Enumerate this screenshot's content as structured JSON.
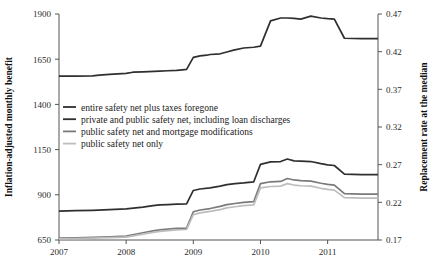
{
  "chart_data": {
    "type": "line",
    "title": "",
    "xlabel": "",
    "ylabel": "Inflation-adjusted monthly benefit",
    "y2label": "Replacement rate at the median",
    "xlim": [
      2007.0,
      2011.75
    ],
    "ylim": [
      650,
      1900
    ],
    "y2lim": [
      0.17,
      0.47
    ],
    "xticks": [
      2007,
      2008,
      2009,
      2010,
      2011
    ],
    "xtick_labels": [
      "2007",
      "2008",
      "2009",
      "2010",
      "2011"
    ],
    "yticks": [
      650,
      900,
      1150,
      1400,
      1650,
      1900
    ],
    "ytick_labels": [
      "650",
      "900",
      "1150",
      "1400",
      "1650",
      "1900"
    ],
    "y2ticks": [
      0.17,
      0.22,
      0.27,
      0.32,
      0.37,
      0.42,
      0.47
    ],
    "y2tick_labels": [
      "0.17",
      "0.22",
      "0.27",
      "0.32",
      "0.37",
      "0.42",
      "0.47"
    ],
    "grid": false,
    "legend_position": "center-left",
    "series": [
      {
        "name": "entire safety net plus taxes foregone",
        "color": "#2f2f2f",
        "width": 1.7,
        "x": [
          2007.0,
          2007.25,
          2007.5,
          2007.6,
          2007.75,
          2008.0,
          2008.1,
          2008.25,
          2008.5,
          2008.62,
          2008.75,
          2008.8,
          2008.9,
          2009.0,
          2009.1,
          2009.2,
          2009.25,
          2009.4,
          2009.5,
          2009.6,
          2009.75,
          2009.9,
          2010.0,
          2010.15,
          2010.3,
          2010.4,
          2010.5,
          2010.6,
          2010.75,
          2010.9,
          2011.0,
          2011.1,
          2011.25,
          2011.5,
          2011.75
        ],
        "y": [
          1556,
          1556,
          1558,
          1562,
          1566,
          1572,
          1578,
          1580,
          1584,
          1586,
          1588,
          1590,
          1594,
          1660,
          1668,
          1672,
          1676,
          1680,
          1690,
          1700,
          1712,
          1716,
          1722,
          1862,
          1878,
          1878,
          1876,
          1872,
          1888,
          1878,
          1874,
          1872,
          1766,
          1764,
          1764
        ]
      },
      {
        "name": "private and public safety net, including loan discharges",
        "color": "#2f2f2f",
        "width": 1.7,
        "x": [
          2007.0,
          2007.25,
          2007.5,
          2007.75,
          2008.0,
          2008.25,
          2008.4,
          2008.5,
          2008.62,
          2008.75,
          2008.9,
          2009.0,
          2009.1,
          2009.25,
          2009.4,
          2009.5,
          2009.62,
          2009.75,
          2009.9,
          2010.0,
          2010.15,
          2010.3,
          2010.4,
          2010.5,
          2010.6,
          2010.75,
          2010.9,
          2011.0,
          2011.1,
          2011.25,
          2011.5,
          2011.75
        ],
        "y": [
          810,
          812,
          814,
          818,
          822,
          832,
          840,
          844,
          846,
          848,
          850,
          924,
          932,
          938,
          948,
          956,
          962,
          966,
          972,
          1068,
          1082,
          1084,
          1098,
          1088,
          1086,
          1084,
          1072,
          1066,
          1062,
          1014,
          1012,
          1012
        ]
      },
      {
        "name": "public safety net and mortgage modifications",
        "color": "#7a7a7a",
        "width": 1.7,
        "x": [
          2007.0,
          2007.25,
          2007.5,
          2007.75,
          2008.0,
          2008.25,
          2008.4,
          2008.5,
          2008.62,
          2008.75,
          2008.9,
          2009.0,
          2009.1,
          2009.25,
          2009.4,
          2009.5,
          2009.62,
          2009.75,
          2009.9,
          2010.0,
          2010.15,
          2010.3,
          2010.4,
          2010.5,
          2010.6,
          2010.75,
          2010.9,
          2011.0,
          2011.1,
          2011.25,
          2011.5,
          2011.75
        ],
        "y": [
          660,
          662,
          664,
          668,
          672,
          690,
          700,
          706,
          710,
          714,
          716,
          806,
          816,
          824,
          836,
          846,
          852,
          858,
          862,
          962,
          972,
          974,
          990,
          982,
          978,
          976,
          964,
          958,
          954,
          906,
          904,
          904
        ]
      },
      {
        "name": "public safety net only",
        "color": "#bdbdbd",
        "width": 1.7,
        "x": [
          2007.0,
          2007.25,
          2007.5,
          2007.75,
          2008.0,
          2008.25,
          2008.4,
          2008.5,
          2008.62,
          2008.75,
          2008.9,
          2009.0,
          2009.1,
          2009.25,
          2009.4,
          2009.5,
          2009.62,
          2009.75,
          2009.9,
          2010.0,
          2010.15,
          2010.3,
          2010.4,
          2010.5,
          2010.6,
          2010.75,
          2010.9,
          2011.0,
          2011.1,
          2011.25,
          2011.5,
          2011.75
        ],
        "y": [
          656,
          658,
          660,
          663,
          666,
          682,
          692,
          698,
          702,
          706,
          708,
          790,
          800,
          808,
          818,
          828,
          834,
          840,
          844,
          938,
          946,
          948,
          962,
          954,
          950,
          948,
          936,
          930,
          926,
          884,
          882,
          882
        ]
      }
    ]
  },
  "legend": {
    "items": [
      {
        "label": "entire safety net plus taxes foregone",
        "color": "#2f2f2f"
      },
      {
        "label": "private and public safety net, including loan discharges",
        "color": "#2f2f2f"
      },
      {
        "label": "public safety net and mortgage modifications",
        "color": "#7a7a7a"
      },
      {
        "label": "public safety net only",
        "color": "#bdbdbd"
      }
    ]
  }
}
